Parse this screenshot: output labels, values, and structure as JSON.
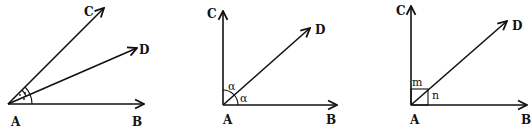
{
  "figures": [
    {
      "id": "fig1",
      "vertex": "A",
      "rays": [
        "B",
        "D",
        "C"
      ],
      "labels": {
        "A": "A",
        "B": "B",
        "C": "C",
        "D": "D"
      },
      "angle_marks": [
        "double-arc with dots (BAD)",
        "arc with dot (DAC)"
      ]
    },
    {
      "id": "fig2",
      "vertex": "A",
      "rays": [
        "B",
        "D",
        "C"
      ],
      "labels": {
        "A": "A",
        "B": "B",
        "C": "C",
        "D": "D"
      },
      "angle_labels": {
        "CAD": "α",
        "DAB": "α"
      }
    },
    {
      "id": "fig3",
      "vertex": "A",
      "rays": [
        "B",
        "D",
        "C"
      ],
      "labels": {
        "A": "A",
        "B": "B",
        "C": "C",
        "D": "D"
      },
      "angle_labels": {
        "CAD": "m",
        "DAB": "n"
      },
      "right_angle_mark": true
    }
  ]
}
